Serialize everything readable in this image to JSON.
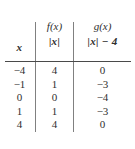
{
  "figure": {
    "type": "table",
    "caption": "",
    "columns": [
      {
        "id": "x",
        "header_top": "",
        "header_bottom": "x"
      },
      {
        "id": "f",
        "header_top": "f(x)",
        "header_bottom": "|x|"
      },
      {
        "id": "g",
        "header_top": "g(x)",
        "header_bottom": "|x| − 4"
      }
    ],
    "rows": [
      {
        "x": "−4",
        "f": "4",
        "g": "0"
      },
      {
        "x": "−1",
        "f": "1",
        "g": "−3"
      },
      {
        "x": "0",
        "f": "0",
        "g": "−4"
      },
      {
        "x": "1",
        "f": "1",
        "g": "−3"
      },
      {
        "x": "4",
        "f": "4",
        "g": "0"
      }
    ],
    "colors": {
      "text": "#2f2f2f",
      "rule": "#4a4a4a",
      "divider": "#808080",
      "background": "#ffffff"
    }
  },
  "chart_data": {
    "type": "table",
    "title": "",
    "columns": [
      "x",
      "f(x) = |x|",
      "g(x) = |x| − 4"
    ],
    "x": [
      -4,
      -1,
      0,
      1,
      4
    ],
    "series": [
      {
        "name": "f(x) = |x|",
        "values": [
          4,
          1,
          0,
          1,
          4
        ]
      },
      {
        "name": "g(x) = |x| - 4",
        "values": [
          0,
          -3,
          -4,
          -3,
          0
        ]
      }
    ],
    "xlabel": "x",
    "ylabel": "",
    "grid": false,
    "legend": "none"
  }
}
